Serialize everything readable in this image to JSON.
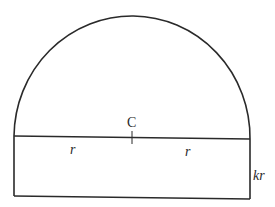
{
  "diagram": {
    "labels": {
      "center": "C",
      "left_radius": "r",
      "right_radius": "r",
      "rect_height": "kr"
    },
    "colors": {
      "stroke": "#2a2a2a",
      "background": "#ffffff"
    }
  }
}
